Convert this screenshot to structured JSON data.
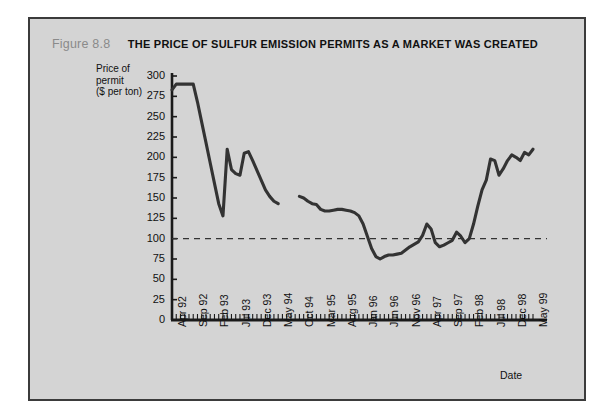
{
  "figure": {
    "number": "Figure 8.8",
    "title": "THE PRICE OF SULFUR EMISSION PERMITS AS A MARKET WAS CREATED"
  },
  "chart_data": {
    "type": "line",
    "title": "THE PRICE OF SULFUR EMISSION PERMITS AS A MARKET WAS CREATED",
    "xlabel": "Date",
    "ylabel": "Price of permit ($ per ton)",
    "ylim": [
      0,
      300
    ],
    "yticks": [
      0,
      25,
      50,
      75,
      100,
      125,
      150,
      175,
      200,
      225,
      250,
      275,
      300
    ],
    "xtick_labels": [
      "Apr 92",
      "Sep 92",
      "Feb 93",
      "Jul 93",
      "Dec 93",
      "May 94",
      "Oct 94",
      "Mar 95",
      "Aug 95",
      "Jan 96",
      "Jun 96",
      "Nov 96",
      "Apr 97",
      "Sep 97",
      "Feb 98",
      "Jul 98",
      "Dec 98",
      "May 99"
    ],
    "xtick_interval_months": 5,
    "x_start": "Apr 92",
    "x_end": "May 99",
    "grid": false,
    "legend": null,
    "line_color": "#333333",
    "reference_line": {
      "value": 100,
      "style": "dashed",
      "color": "#333333"
    },
    "series": [
      {
        "name": "Sulfur emission permit price (segment 1)",
        "x": [
          "Apr 92",
          "May 92",
          "Jun 92",
          "Jul 92",
          "Aug 92",
          "Sep 92",
          "Oct 92",
          "Nov 92",
          "Dec 92",
          "Jan 93",
          "Feb 93",
          "Mar 93",
          "Apr 93",
          "May 93",
          "Jun 93",
          "Jul 93",
          "Aug 93",
          "Sep 93",
          "Oct 93",
          "Nov 93",
          "Dec 93",
          "Jan 94",
          "Feb 94",
          "Mar 94",
          "Apr 94",
          "May 94"
        ],
        "values": [
          283,
          290,
          290,
          290,
          290,
          290,
          268,
          243,
          218,
          193,
          168,
          143,
          128,
          210,
          185,
          180,
          178,
          205,
          207,
          196,
          184,
          172,
          160,
          152,
          146,
          143
        ]
      },
      {
        "name": "Sulfur emission permit price (segment 2)",
        "x": [
          "Oct 94",
          "Nov 94",
          "Dec 94",
          "Jan 95",
          "Feb 95",
          "Mar 95",
          "Apr 95",
          "May 95",
          "Jun 95",
          "Jul 95",
          "Aug 95",
          "Sep 95",
          "Oct 95",
          "Nov 95",
          "Dec 95",
          "Jan 96",
          "Feb 96",
          "Mar 96",
          "Apr 96",
          "May 96",
          "Jun 96",
          "Jul 96",
          "Aug 96",
          "Sep 96",
          "Oct 96",
          "Nov 96",
          "Dec 96",
          "Jan 97",
          "Feb 97",
          "Mar 97",
          "Apr 97",
          "May 97",
          "Jun 97",
          "Jul 97",
          "Aug 97",
          "Sep 97",
          "Oct 97",
          "Nov 97",
          "Dec 97",
          "Jan 98",
          "Feb 98",
          "Mar 98",
          "Apr 98",
          "May 98",
          "Jun 98",
          "Jul 98",
          "Aug 98",
          "Sep 98",
          "Oct 98",
          "Nov 98",
          "Dec 98",
          "Jan 99",
          "Feb 99",
          "Mar 99",
          "Apr 99",
          "May 99"
        ],
        "values": [
          152,
          150,
          146,
          143,
          142,
          136,
          134,
          134,
          135,
          136,
          136,
          135,
          134,
          132,
          128,
          118,
          103,
          88,
          78,
          75,
          78,
          80,
          80,
          81,
          82,
          86,
          90,
          93,
          96,
          104,
          118,
          112,
          95,
          90,
          92,
          95,
          98,
          108,
          103,
          95,
          100,
          118,
          140,
          160,
          172,
          198,
          196,
          178,
          186,
          196,
          203,
          200,
          196,
          206,
          203,
          210
        ]
      }
    ]
  }
}
